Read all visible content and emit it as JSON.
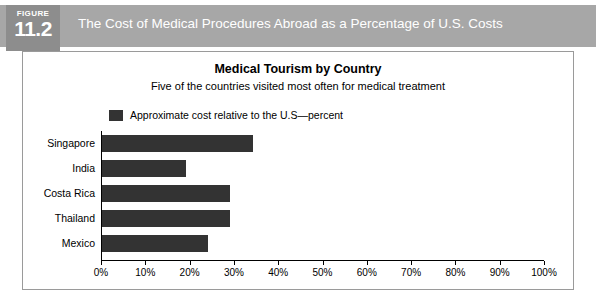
{
  "header": {
    "figure_word": "FIGURE",
    "figure_number": "11.2",
    "title": "The Cost of Medical Procedures Abroad as a Percentage of U.S. Costs",
    "banner_color": "#a7a7a7",
    "badge_color": "#8d8d8d",
    "text_color": "#ffffff"
  },
  "chart_data": {
    "type": "bar",
    "orientation": "horizontal",
    "title": "Medical Tourism by Country",
    "subtitle": "Five of the countries visited most often for medical treatment",
    "categories": [
      "Singapore",
      "India",
      "Costa Rica",
      "Thailand",
      "Mexico"
    ],
    "values": [
      34,
      19,
      29,
      29,
      24
    ],
    "series": [
      {
        "name": "Approximate cost relative to the U.S—percent",
        "values": [
          34,
          19,
          29,
          29,
          24
        ],
        "color": "#333333"
      }
    ],
    "xlabel": "",
    "ylabel": "",
    "xlim": [
      0,
      100
    ],
    "xticks": [
      0,
      10,
      20,
      30,
      40,
      50,
      60,
      70,
      80,
      90,
      100
    ],
    "xticklabels": [
      "0%",
      "10%",
      "20%",
      "30%",
      "40%",
      "50%",
      "60%",
      "70%",
      "80%",
      "90%",
      "100%"
    ],
    "grid": false,
    "legend": {
      "position": "top-left",
      "entries": [
        {
          "label": "Approximate cost relative to the U.S—percent",
          "color": "#333333"
        }
      ]
    },
    "bar_color": "#333333",
    "axis_color": "#000000",
    "background": "#ffffff"
  }
}
